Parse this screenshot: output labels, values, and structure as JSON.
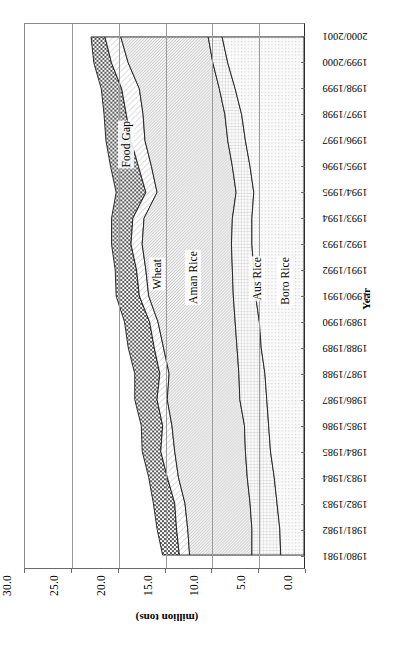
{
  "chart_data": {
    "type": "area",
    "title": "",
    "subtitle": "",
    "orientation": "rotated-90",
    "xlabel": "Year",
    "ylabel": "(million tons)",
    "ylim": [
      0.0,
      30.0
    ],
    "yticks": [
      "0.0",
      "5.0",
      "10.0",
      "15.0",
      "20.0",
      "25.0",
      "30.0"
    ],
    "ytick_values": [
      0.0,
      5.0,
      10.0,
      15.0,
      20.0,
      25.0,
      30.0
    ],
    "grid": true,
    "legend": "in-plot labels",
    "stacked": true,
    "categories": [
      "1980/1981",
      "1981/1982",
      "1982/1983",
      "1983/1984",
      "1984/1985",
      "1985/1986",
      "1986/1987",
      "1987/1988",
      "1988/1989",
      "1989/1990",
      "1990/1991",
      "1991/1992",
      "1992/1993",
      "1993/1994",
      "1994/1995",
      "1995/1996",
      "1996/1997",
      "1997/1998",
      "1998/1999",
      "1999/2000",
      "2000/2001"
    ],
    "series": [
      {
        "name": "Boro Rice",
        "pattern": "fine-dot",
        "values": [
          2.5,
          2.6,
          2.9,
          3.2,
          3.6,
          3.8,
          4.0,
          4.2,
          4.6,
          4.8,
          5.2,
          5.4,
          5.6,
          5.6,
          5.4,
          5.8,
          6.3,
          6.7,
          7.4,
          8.2,
          8.8
        ]
      },
      {
        "name": "Aus Rice",
        "pattern": "fine-grid",
        "values": [
          3.1,
          3.0,
          2.9,
          2.9,
          2.7,
          2.6,
          2.9,
          2.8,
          2.6,
          2.6,
          2.4,
          2.3,
          2.2,
          2.1,
          1.9,
          1.9,
          1.9,
          1.8,
          1.7,
          1.6,
          1.5
        ]
      },
      {
        "name": "Aman Rice",
        "pattern": "diagonal-hatch",
        "values": [
          6.7,
          6.9,
          7.0,
          7.4,
          7.6,
          7.8,
          7.8,
          7.5,
          7.9,
          8.3,
          9.1,
          9.3,
          9.6,
          9.5,
          8.5,
          8.7,
          8.9,
          8.8,
          8.6,
          9.1,
          9.4
        ]
      },
      {
        "name": "Wheat",
        "pattern": "light-diagonal-hatch",
        "values": [
          1.1,
          1.2,
          1.1,
          1.2,
          1.5,
          1.0,
          1.1,
          1.0,
          1.0,
          0.9,
          1.0,
          1.0,
          1.2,
          1.2,
          1.2,
          1.4,
          1.5,
          1.8,
          1.9,
          1.8,
          1.7
        ]
      },
      {
        "name": "Food Gap",
        "pattern": "checkerboard",
        "values": [
          1.8,
          2.1,
          2.3,
          2.0,
          2.0,
          2.3,
          2.4,
          2.7,
          2.8,
          2.7,
          2.5,
          2.3,
          2.1,
          2.3,
          3.2,
          3.0,
          2.7,
          2.4,
          2.2,
          1.9,
          1.5
        ]
      }
    ],
    "stack_order_from_zero": [
      "Boro Rice",
      "Aus Rice",
      "Aman Rice",
      "Wheat",
      "Food Gap"
    ],
    "colors": {
      "food_gap_fill": "#8c8c8c",
      "wheat_fill": "#f2f2f2",
      "aman_fill": "#dcdcdc",
      "aus_fill": "#ededed",
      "boro_fill": "#f0f0f0",
      "outline": "#1a1a1a",
      "axis": "#6b6b6b",
      "gridline": "#9b9b9b",
      "plot_background": "#ffffff"
    }
  },
  "axes": {
    "value_axis_title": "(million tons)",
    "year_axis_title": "Year"
  },
  "series_labels": [
    {
      "id": "food-gap",
      "text": "Food Gap"
    },
    {
      "id": "wheat",
      "text": "Wheat"
    },
    {
      "id": "aman-rice",
      "text": "Aman Rice"
    },
    {
      "id": "aus-rice",
      "text": "Aus Rice"
    },
    {
      "id": "boro-rice",
      "text": "Boro Rice"
    }
  ]
}
